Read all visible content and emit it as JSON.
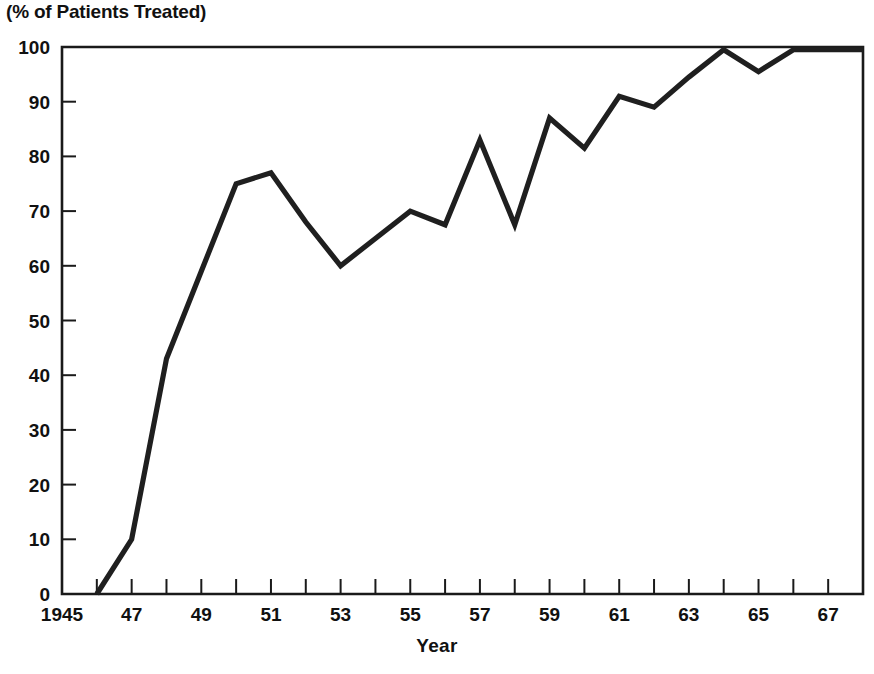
{
  "chart_data": {
    "type": "line",
    "title": "(% of Patients Treated)",
    "xlabel": "Year",
    "ylabel": "",
    "xlim": [
      1945,
      1968
    ],
    "ylim": [
      0,
      100
    ],
    "grid": false,
    "legend": null,
    "x_tick_labels": [
      "1945",
      "47",
      "49",
      "51",
      "53",
      "55",
      "57",
      "59",
      "61",
      "63",
      "65",
      "67"
    ],
    "x_tick_values": [
      1945,
      1947,
      1949,
      1951,
      1953,
      1955,
      1957,
      1959,
      1961,
      1963,
      1965,
      1967
    ],
    "x_minor_ticks": [
      1946,
      1948,
      1950,
      1952,
      1954,
      1956,
      1958,
      1960,
      1962,
      1964,
      1966,
      1968
    ],
    "y_tick_labels": [
      "0",
      "10",
      "20",
      "30",
      "40",
      "50",
      "60",
      "70",
      "80",
      "90",
      "100"
    ],
    "y_tick_values": [
      0,
      10,
      20,
      30,
      40,
      50,
      60,
      70,
      80,
      90,
      100
    ],
    "series": [
      {
        "name": "% of Patients Treated",
        "color": "#1f1f1f",
        "x": [
          1946,
          1947,
          1948,
          1949,
          1950,
          1951,
          1952,
          1953,
          1954,
          1955,
          1956,
          1957,
          1958,
          1959,
          1960,
          1961,
          1962,
          1963,
          1964,
          1965,
          1966,
          1967,
          1968
        ],
        "values": [
          0,
          10,
          43,
          59,
          75,
          77,
          68,
          60,
          65,
          70,
          67.5,
          83,
          67.5,
          87,
          81.5,
          91,
          89,
          94.5,
          99.5,
          95.5,
          99.5,
          99.5,
          99.5
        ]
      }
    ]
  },
  "axes": {
    "title_text": "(% of Patients Treated)",
    "x_axis_title": "Year"
  }
}
